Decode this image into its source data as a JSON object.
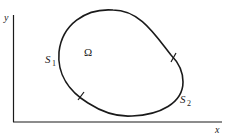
{
  "diagram": {
    "axes": {
      "x_label": "x",
      "y_label": "y"
    },
    "region_label": "Ω",
    "boundary_labels": {
      "s1": "S",
      "s1_sub": "1",
      "s2": "S",
      "s2_sub": "2"
    },
    "colors": {
      "stroke": "#1a1a1a",
      "background": "#ffffff"
    }
  }
}
